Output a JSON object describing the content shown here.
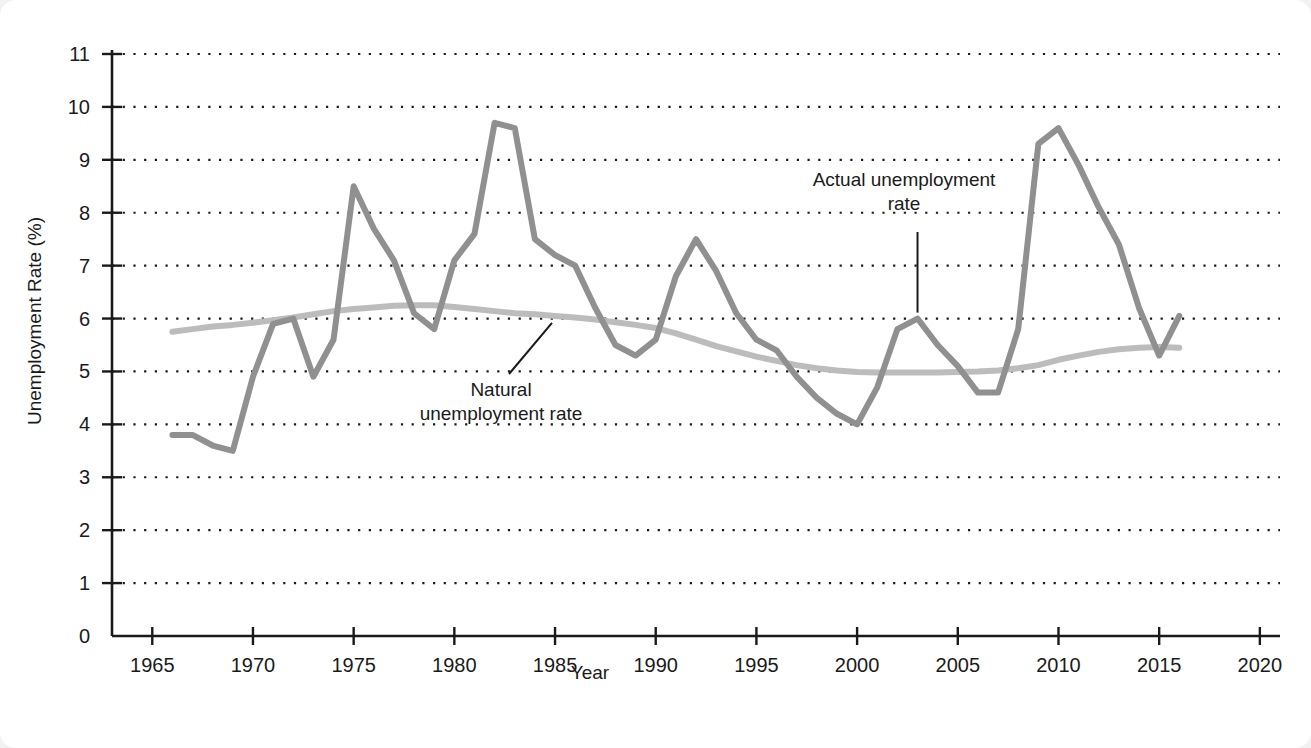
{
  "figure": {
    "background": "#ffffff",
    "page_background": "#f2f2f2"
  },
  "annotations": {
    "actual": "Actual unemployment\nrate",
    "natural": "Natural\nunemployment rate"
  },
  "colors": {
    "actual_line": "#909090",
    "natural_line": "#bcbcbc",
    "axis": "#1a1a1a",
    "gridline": "#1a1a1a"
  },
  "chart_data": {
    "type": "line",
    "title": "",
    "xlabel": "Year",
    "ylabel": "Unemployment Rate (%)",
    "xlim": [
      1963,
      2021
    ],
    "ylim": [
      0,
      11
    ],
    "xticks": [
      1965,
      1970,
      1975,
      1980,
      1985,
      1990,
      1995,
      2000,
      2005,
      2010,
      2015,
      2020
    ],
    "yticks": [
      0,
      1,
      2,
      3,
      4,
      5,
      6,
      7,
      8,
      9,
      10,
      11
    ],
    "xtick_labels": [
      "1965",
      "1970",
      "1975",
      "1980",
      "1985",
      "1990",
      "1995",
      "2000",
      "2005",
      "2010",
      "2015",
      "2020"
    ],
    "ytick_labels": [
      "0",
      "1",
      "2",
      "3",
      "4",
      "5",
      "6",
      "7",
      "8",
      "9",
      "10",
      "11"
    ],
    "grid": true,
    "grid_style": "dotted-horizontal",
    "legend": "annotated-inline",
    "series": [
      {
        "name": "Actual unemployment rate",
        "color": "#909090",
        "x": [
          1966,
          1967,
          1968,
          1969,
          1970,
          1971,
          1972,
          1973,
          1974,
          1975,
          1976,
          1977,
          1978,
          1979,
          1980,
          1981,
          1982,
          1983,
          1984,
          1985,
          1986,
          1987,
          1988,
          1989,
          1990,
          1991,
          1992,
          1993,
          1994,
          1995,
          1996,
          1997,
          1998,
          1999,
          2000,
          2001,
          2002,
          2003,
          2004,
          2005,
          2006,
          2007,
          2008,
          2009,
          2010,
          2011,
          2012,
          2013,
          2014,
          2015,
          2016
        ],
        "values": [
          3.8,
          3.8,
          3.6,
          3.5,
          4.9,
          5.9,
          6.0,
          4.9,
          5.6,
          8.5,
          7.7,
          7.1,
          6.1,
          5.8,
          7.1,
          7.6,
          9.7,
          9.6,
          7.5,
          7.2,
          7.0,
          6.2,
          5.5,
          5.3,
          5.6,
          6.8,
          7.5,
          6.9,
          6.1,
          5.6,
          5.4,
          4.9,
          4.5,
          4.2,
          4.0,
          4.7,
          5.8,
          6.0,
          5.5,
          5.1,
          4.6,
          4.6,
          5.8,
          9.3,
          9.6,
          8.9,
          8.1,
          7.4,
          6.2,
          5.3,
          6.05
        ]
      },
      {
        "name": "Natural unemployment rate",
        "color": "#bcbcbc",
        "x": [
          1966,
          1967,
          1968,
          1969,
          1970,
          1971,
          1972,
          1973,
          1974,
          1975,
          1976,
          1977,
          1978,
          1979,
          1980,
          1981,
          1982,
          1983,
          1984,
          1985,
          1986,
          1987,
          1988,
          1989,
          1990,
          1991,
          1992,
          1993,
          1994,
          1995,
          1996,
          1997,
          1998,
          1999,
          2000,
          2001,
          2002,
          2003,
          2004,
          2005,
          2006,
          2007,
          2008,
          2009,
          2010,
          2011,
          2012,
          2013,
          2014,
          2015,
          2016
        ],
        "values": [
          5.75,
          5.8,
          5.85,
          5.88,
          5.92,
          5.97,
          6.02,
          6.08,
          6.14,
          6.18,
          6.21,
          6.24,
          6.25,
          6.25,
          6.22,
          6.18,
          6.14,
          6.1,
          6.08,
          6.05,
          6.02,
          5.98,
          5.93,
          5.88,
          5.82,
          5.72,
          5.6,
          5.48,
          5.38,
          5.28,
          5.2,
          5.12,
          5.06,
          5.02,
          4.99,
          4.98,
          4.98,
          4.98,
          4.98,
          4.99,
          5.0,
          5.02,
          5.06,
          5.12,
          5.22,
          5.3,
          5.37,
          5.42,
          5.45,
          5.46,
          5.45
        ]
      }
    ]
  }
}
